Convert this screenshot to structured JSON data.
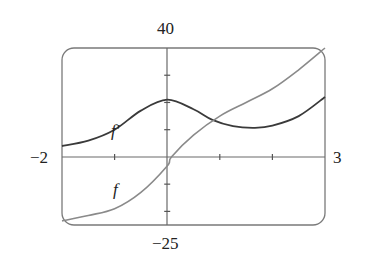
{
  "chart_data": {
    "type": "line",
    "title": "",
    "xlabel": "",
    "ylabel": "",
    "xlim": [
      -2,
      3
    ],
    "ylim": [
      -25,
      40
    ],
    "x_tick_labels": {
      "left": "-2",
      "right": "3"
    },
    "y_tick_labels": {
      "top": "40",
      "bottom": "−25"
    },
    "x_ticks": [
      -1,
      1,
      2
    ],
    "y_ticks": [
      -20,
      -10,
      10,
      20,
      30
    ],
    "grid": false,
    "series": [
      {
        "name": "f′",
        "color": "#3a3a3a",
        "x": [
          -2,
          -1.5,
          -1,
          -0.5,
          0,
          0.5,
          0.86,
          1.25,
          1.67,
          2.0,
          2.5,
          3.0
        ],
        "y": [
          4,
          6,
          10,
          17,
          21,
          17.5,
          13.6,
          11.3,
          10.7,
          11.5,
          15,
          22
        ]
      },
      {
        "name": "f",
        "color": "#808080",
        "x": [
          -2,
          -1.5,
          -1,
          -0.5,
          0,
          0.08,
          0.5,
          1.0,
          1.5,
          2.0,
          2.5,
          3.0
        ],
        "y": [
          -23.5,
          -21.5,
          -19,
          -13,
          -3.3,
          0,
          8,
          15,
          20,
          25,
          32,
          40
        ]
      }
    ],
    "annotations": [
      {
        "text": "f′",
        "x": -0.95,
        "y": 9
      },
      {
        "text": "f",
        "x": -0.95,
        "y": -13
      }
    ]
  },
  "labels": {
    "y_top": "40",
    "y_bottom": "−25",
    "x_left": "−2",
    "x_right": "3",
    "f_prime": "f′",
    "f": "f"
  }
}
